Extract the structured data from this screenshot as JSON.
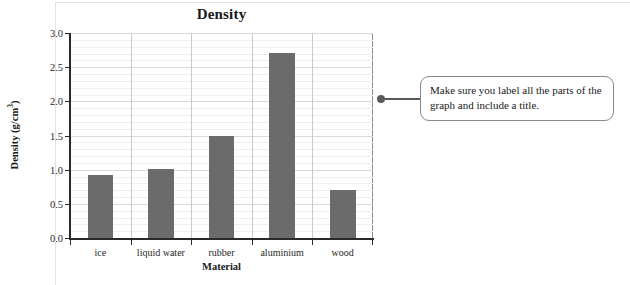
{
  "chart_data": {
    "type": "bar",
    "title": "Density",
    "xlabel": "Material",
    "ylabel": "Density (g/cm3)",
    "ylabel_base": "Density (g/cm",
    "ylabel_sup": "3",
    "ylabel_close": ")",
    "categories": [
      "ice",
      "liquid water",
      "rubber",
      "aluminium",
      "wood"
    ],
    "values": [
      0.92,
      1.01,
      1.5,
      2.71,
      0.7
    ],
    "ylim": [
      0.0,
      3.0
    ],
    "ytick_labels": [
      "0.0",
      "0.5",
      "1.0",
      "1.5",
      "2.0",
      "2.5",
      "3.0"
    ],
    "ytick_values": [
      0.0,
      0.5,
      1.0,
      1.5,
      2.0,
      2.5,
      3.0
    ],
    "minor_gridline_step": 0.1,
    "grid": true,
    "legend": "none",
    "bar_color": "#6b6b6b",
    "axis_color": "#2a2a2a",
    "major_grid_color": "#d9d9d9",
    "minor_grid_color": "#f0eeee"
  },
  "callout": {
    "text": "Make sure you label all the parts of the graph and include a title.",
    "border_color": "#8a8a8a",
    "dot_color": "#5a5a5a"
  }
}
